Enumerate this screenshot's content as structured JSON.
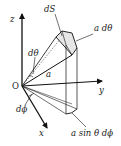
{
  "diagram": {
    "labels": {
      "z": "z",
      "y": "y",
      "x": "x",
      "origin": "O",
      "dS": "dS",
      "a_dtheta": "a dθ",
      "dtheta": "dθ",
      "a": "a",
      "dphi": "dϕ",
      "a_sin_theta_dphi": "a sin θ dϕ"
    },
    "colors": {
      "stroke": "#1a1a1a",
      "patch_fill": "#e6e6e6",
      "background": "#ffffff"
    }
  }
}
